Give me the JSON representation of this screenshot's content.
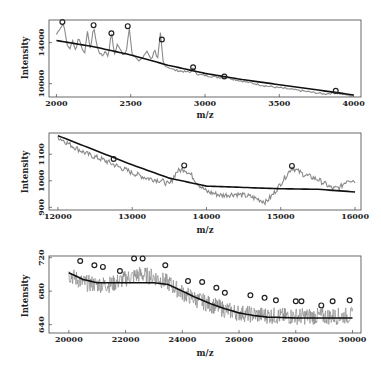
{
  "chart_data": [
    {
      "type": "line",
      "title": "",
      "xlabel": "m/z",
      "ylabel": "Intensity",
      "xlim": [
        1950,
        4050
      ],
      "ylim": [
        8700,
        16200
      ],
      "xticks": [
        2000,
        2500,
        3000,
        3500,
        4000
      ],
      "yticks": [
        10000,
        14000
      ],
      "grid": false,
      "series": [
        {
          "name": "spectrum",
          "color": "#888888",
          "x": [
            2000,
            2020,
            2040,
            2050,
            2070,
            2090,
            2110,
            2130,
            2150,
            2170,
            2190,
            2210,
            2230,
            2250,
            2270,
            2290,
            2310,
            2330,
            2350,
            2370,
            2390,
            2410,
            2430,
            2450,
            2470,
            2490,
            2510,
            2530,
            2550,
            2580,
            2610,
            2640,
            2660,
            2680,
            2700,
            2720,
            2750,
            2800,
            2850,
            2900,
            2920,
            2950,
            3000,
            3050,
            3100,
            3130,
            3200,
            3300,
            3400,
            3500,
            3600,
            3700,
            3800,
            3880,
            3950,
            4000
          ],
          "values": [
            14800,
            15300,
            15700,
            15900,
            13800,
            13400,
            14200,
            13200,
            14600,
            13500,
            13000,
            15100,
            13200,
            15700,
            13800,
            13000,
            12700,
            13200,
            12600,
            15200,
            12800,
            13800,
            13400,
            12700,
            13100,
            15500,
            12900,
            12600,
            12200,
            12500,
            13200,
            12300,
            13400,
            12200,
            14900,
            11900,
            11600,
            11300,
            11200,
            11100,
            11500,
            10900,
            10800,
            10700,
            10600,
            10700,
            10400,
            10100,
            9800,
            9600,
            9400,
            9200,
            9000,
            9100,
            8900,
            8800
          ]
        },
        {
          "name": "baseline",
          "color": "#111111",
          "x": [
            2000,
            2250,
            2500,
            2750,
            3000,
            3250,
            3500,
            3750,
            4000
          ],
          "values": [
            14200,
            13600,
            12800,
            11800,
            11000,
            10400,
            9900,
            9400,
            8900
          ]
        }
      ],
      "peaks": {
        "x": [
          2040,
          2250,
          2370,
          2480,
          2710,
          2920,
          3130,
          3880
        ],
        "y": [
          16000,
          15700,
          14900,
          15600,
          14300,
          11600,
          10700,
          9300
        ]
      }
    },
    {
      "type": "line",
      "title": "",
      "xlabel": "m/z",
      "ylabel": "Intensity",
      "xlim": [
        11880,
        16080
      ],
      "ylim": [
        890,
        1180
      ],
      "xticks": [
        12000,
        13000,
        14000,
        15000,
        16000
      ],
      "yticks": [
        900,
        1000,
        1100
      ],
      "grid": false,
      "series": [
        {
          "name": "spectrum",
          "color": "#888888",
          "x": [
            12000,
            12200,
            12400,
            12600,
            12800,
            13000,
            13200,
            13400,
            13500,
            13600,
            13700,
            13800,
            13900,
            14000,
            14200,
            14400,
            14600,
            14800,
            14900,
            15000,
            15100,
            15150,
            15300,
            15500,
            15700,
            15800,
            15900,
            16000
          ],
          "values": [
            1165,
            1130,
            1100,
            1080,
            1055,
            1030,
            1010,
            1000,
            985,
            1035,
            1045,
            1020,
            985,
            960,
            945,
            950,
            940,
            920,
            950,
            990,
            1030,
            1050,
            1025,
            1005,
            970,
            975,
            1005,
            1000
          ]
        },
        {
          "name": "baseline",
          "color": "#111111",
          "x": [
            12000,
            12500,
            13000,
            13500,
            14000,
            14500,
            15000,
            15500,
            16000
          ],
          "values": [
            1170,
            1115,
            1060,
            1010,
            980,
            975,
            970,
            968,
            958
          ]
        }
      ],
      "peaks": {
        "x": [
          12750,
          13700,
          15150
        ],
        "y": [
          1082,
          1058,
          1056
        ]
      }
    },
    {
      "type": "line",
      "title": "",
      "xlabel": "m/z",
      "ylabel": "Intensity",
      "xlim": [
        19300,
        30300
      ],
      "ylim": [
        630,
        722
      ],
      "xticks": [
        20000,
        22000,
        24000,
        26000,
        28000,
        30000
      ],
      "yticks": [
        640,
        680,
        720
      ],
      "grid": false,
      "series": [
        {
          "name": "spectrum",
          "color": "#888888",
          "x": [
            20000,
            20500,
            21000,
            21500,
            22000,
            22500,
            23000,
            23500,
            24000,
            24500,
            25000,
            25500,
            26000,
            26500,
            27000,
            27500,
            28000,
            28500,
            29000,
            29500,
            30000
          ],
          "values": [
            700,
            690,
            688,
            688,
            695,
            700,
            697,
            690,
            678,
            670,
            664,
            658,
            654,
            652,
            651,
            650,
            650,
            650,
            650,
            650,
            651
          ]
        },
        {
          "name": "baseline",
          "color": "#111111",
          "x": [
            20000,
            20500,
            21000,
            21500,
            22000,
            22500,
            23000,
            23500,
            24000,
            24500,
            25000,
            25500,
            26000,
            26500,
            27000,
            28000,
            29000,
            30000
          ],
          "values": [
            702,
            694,
            690,
            690,
            690,
            690,
            690,
            688,
            680,
            672,
            665,
            659,
            654,
            651,
            649,
            648,
            648,
            648
          ]
        }
      ],
      "peaks": {
        "x": [
          20400,
          20900,
          21200,
          21800,
          22300,
          22600,
          23400,
          24200,
          24700,
          25200,
          25500,
          26400,
          26900,
          27300,
          28000,
          28200,
          28900,
          29300,
          29900
        ],
        "y": [
          716,
          711,
          709,
          704,
          719,
          719,
          711,
          692,
          691,
          684,
          678,
          675,
          672,
          669,
          668,
          668,
          663,
          668,
          669
        ]
      }
    }
  ],
  "panels": [
    {
      "ylabel": "Intensity",
      "xlabel": "m/z",
      "xtick_labels": [
        "2000",
        "2500",
        "3000",
        "3500",
        "4000"
      ],
      "ytick_labels": [
        "10000",
        "14000"
      ]
    },
    {
      "ylabel": "Intensity",
      "xlabel": "m/z",
      "xtick_labels": [
        "12000",
        "13000",
        "14000",
        "15000",
        "16000"
      ],
      "ytick_labels": [
        "900",
        "1000",
        "1100"
      ]
    },
    {
      "ylabel": "Intensity",
      "xlabel": "m/z",
      "xtick_labels": [
        "20000",
        "22000",
        "24000",
        "26000",
        "28000",
        "30000"
      ],
      "ytick_labels": [
        "640",
        "680",
        "720"
      ]
    }
  ],
  "colors": {
    "spectrum": "#8a8a8a",
    "baseline": "#111111",
    "peak_marker": "#222222",
    "frame": "#444444"
  }
}
